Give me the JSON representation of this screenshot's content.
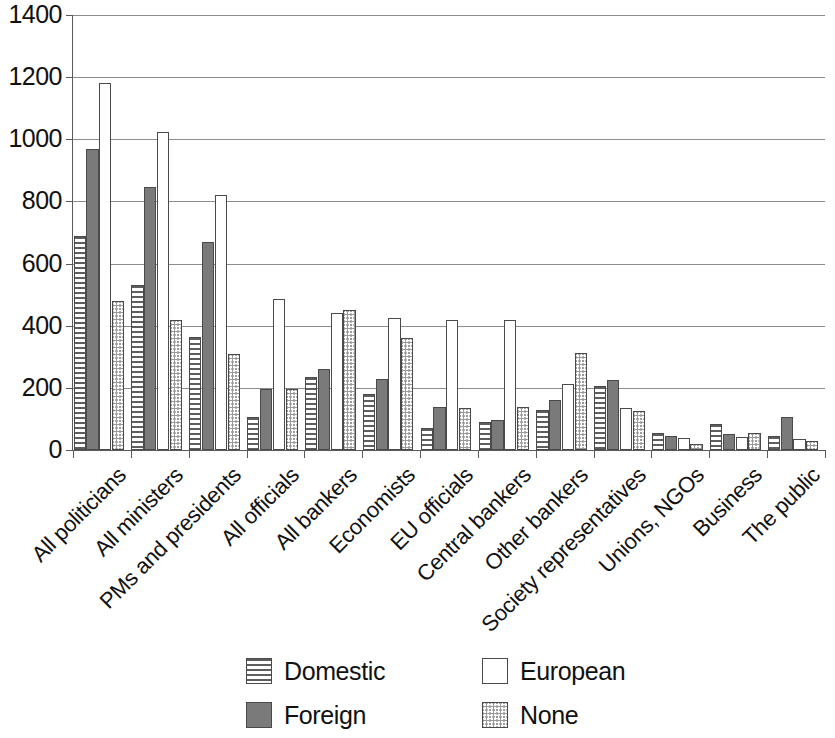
{
  "chart_data": {
    "type": "bar",
    "title": "",
    "subtitle": "",
    "xlabel": "",
    "ylabel": "",
    "ylim": [
      0,
      1400
    ],
    "ytick_values": [
      0,
      200,
      400,
      600,
      800,
      1000,
      1200,
      1400
    ],
    "ytick_labels": [
      "0",
      "200",
      "400",
      "600",
      "800",
      "1000",
      "1200",
      "1400"
    ],
    "grid": "horizontal",
    "legend_position": "bottom",
    "orientation": "vertical",
    "categories": [
      "All politicians",
      "All ministers",
      "PMs and presidents",
      "All officials",
      "All bankers",
      "Economists",
      "EU officials",
      "Central bankers",
      "Other bankers",
      "Society representatives",
      "Unions, NGOs",
      "Business",
      "The public"
    ],
    "series": [
      {
        "name": "Domestic",
        "pattern": "horizontal-stripes",
        "color": "#ffffff",
        "values": [
          690,
          530,
          365,
          105,
          235,
          180,
          70,
          90,
          130,
          205,
          55,
          85,
          45
        ]
      },
      {
        "name": "Foreign",
        "pattern": "solid-gray",
        "color": "#7a7a7a",
        "values": [
          970,
          845,
          670,
          195,
          260,
          228,
          140,
          95,
          160,
          225,
          45,
          50,
          105
        ]
      },
      {
        "name": "European",
        "pattern": "empty-white",
        "color": "#ffffff",
        "values": [
          1180,
          1025,
          822,
          485,
          440,
          425,
          418,
          418,
          212,
          135,
          40,
          42,
          35
        ]
      },
      {
        "name": "None",
        "pattern": "dotted-checker",
        "color": "#9a9a9a",
        "values": [
          480,
          420,
          308,
          195,
          450,
          360,
          135,
          138,
          312,
          125,
          20,
          55,
          28
        ]
      }
    ]
  },
  "legend": {
    "entries": [
      {
        "label": "Domestic",
        "pattern": "horizontal-stripes"
      },
      {
        "label": "European",
        "pattern": "empty-white"
      },
      {
        "label": "Foreign",
        "pattern": "solid-gray"
      },
      {
        "label": "None",
        "pattern": "dotted-checker"
      }
    ]
  },
  "colors": {
    "axis": "#5a5a5a",
    "gridline": "#8c8c8c",
    "bar_outline": "#4a4a4a",
    "text": "#111111",
    "background": "#ffffff"
  }
}
